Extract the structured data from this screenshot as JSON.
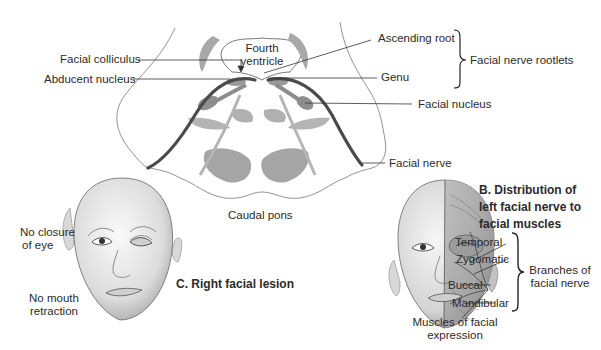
{
  "pons": {
    "fourth_ventricle": [
      "Fourth",
      "ventricle"
    ],
    "caption": "Caudal pons",
    "labels": {
      "facial_colliculus": "Facial colliculus",
      "abducent_nucleus": "Abducent nucleus",
      "ascending_root": "Ascending root",
      "genu": "Genu",
      "facial_nucleus": "Facial nucleus",
      "facial_nerve": "Facial nerve"
    },
    "rootlets_group": "Facial nerve rootlets"
  },
  "panel_b": {
    "title": [
      "B. Distribution of",
      "left facial nerve to",
      "facial muscles"
    ],
    "branches": [
      "Temporal",
      "Zygomatic",
      "Buccal",
      "Mandibular"
    ],
    "branches_group": [
      "Branches of",
      "facial nerve"
    ],
    "muscles_caption": [
      "Muscles of facial",
      "expression"
    ]
  },
  "panel_c": {
    "title": "C. Right facial lesion",
    "eye_label": [
      "No closure",
      "of eye"
    ],
    "mouth_label": [
      "No mouth",
      "retraction"
    ]
  },
  "colors": {
    "outline": "#555555",
    "nucleus_fill": "#a8a8a8",
    "nerve": "#4a4a4a",
    "skin": "#e6e6e6"
  }
}
